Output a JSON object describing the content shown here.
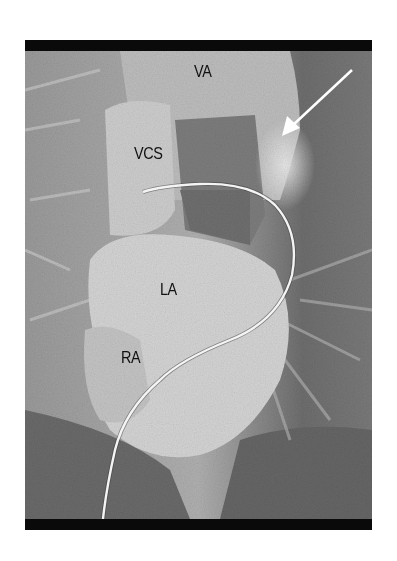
{
  "figure": {
    "type": "angiography-xray",
    "colors": {
      "background": "#ffffff",
      "frame_band": "#0a0a0a",
      "lung_field": "#8a8a8a",
      "dark_lower": "#5e5e5e",
      "contrast_bright": "#d8d8d8",
      "catheter": "#f2f2f2",
      "arrow": "#ffffff"
    },
    "labels": [
      {
        "id": "va",
        "text": "VA",
        "x": 194,
        "y": 62
      },
      {
        "id": "vcs",
        "text": "VCS",
        "x": 134,
        "y": 144
      },
      {
        "id": "la",
        "text": "LA",
        "x": 160,
        "y": 280
      },
      {
        "id": "ra",
        "text": "RA",
        "x": 121,
        "y": 348
      }
    ],
    "arrow": {
      "from": [
        352,
        70
      ],
      "to": [
        283,
        135
      ],
      "icon": "arrow-down-left-icon"
    }
  }
}
